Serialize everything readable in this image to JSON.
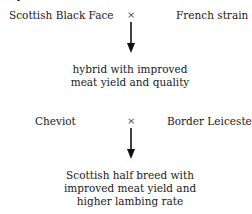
{
  "cross1": {
    "left_parent": "Scottish Black Face",
    "symbol": "×",
    "right_parent": "French strain",
    "offspring": [
      "hybrid with improved",
      "meat yield and quality"
    ]
  },
  "cross2": {
    "left_parent": "Cheviot",
    "symbol": "×",
    "right_parent": "Border Leicester",
    "offspring": [
      "Scottish half breed with",
      "improved meat yield and",
      "higher lambing rate"
    ]
  }
}
